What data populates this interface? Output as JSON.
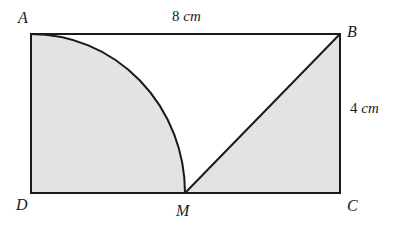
{
  "figure": {
    "type": "geometry-diagram",
    "colors": {
      "stroke": "#1a1a1a",
      "shaded_fill": "#e3e3e3",
      "unshaded_fill": "#ffffff",
      "background": "#ffffff",
      "label_color": "#1a1a1a"
    },
    "stroke_width": 2,
    "vertices": [
      {
        "id": "A",
        "label": "A",
        "x": 31,
        "y": 34,
        "label_x": 18,
        "label_y": 10
      },
      {
        "id": "B",
        "label": "B",
        "x": 340,
        "y": 34,
        "label_x": 347,
        "label_y": 24
      },
      {
        "id": "C",
        "label": "C",
        "x": 340,
        "y": 193,
        "label_x": 347,
        "label_y": 198
      },
      {
        "id": "D",
        "label": "D",
        "x": 31,
        "y": 193,
        "label_x": 16,
        "label_y": 197
      },
      {
        "id": "M",
        "label": "M",
        "x": 185,
        "y": 193,
        "label_x": 176,
        "label_y": 203
      }
    ],
    "dimensions": [
      {
        "id": "top-width",
        "num": "8",
        "unit": "cm",
        "label_x": 172,
        "label_y": 9
      },
      {
        "id": "right-height",
        "num": "4",
        "unit": "cm",
        "label_x": 350,
        "label_y": 101
      }
    ],
    "geometry": {
      "rect_x": 31,
      "rect_y": 34,
      "rect_width": 309,
      "rect_height": 159,
      "arc_center_x": 31,
      "arc_center_y": 193,
      "arc_radius_x": 154,
      "arc_radius_y": 159,
      "shaded_path": "M 31 34 A 154 159 0 0 1 185 193 L 340 34 L 340 193 L 31 193 Z",
      "unshaded_path": "M 31 34 L 340 34 L 185 193 A 154 159 0 0 0 31 34 Z",
      "arc_path": "M 31 34 A 154 159 0 0 1 185 193",
      "diagonal_path": "M 185 193 L 340 34",
      "rect_outline_path": "M 31 34 L 340 34 L 340 193 L 31 193 Z"
    }
  }
}
